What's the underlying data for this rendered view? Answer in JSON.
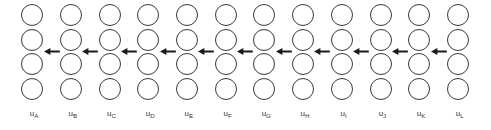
{
  "diagram": {
    "type": "node-chain-diagram",
    "background_color": "#ffffff",
    "stroke_color": "#3a3a3a",
    "arrow_color": "#1a1a1a",
    "label_color": "#333333",
    "rows_per_column": 4,
    "arrow_direction": "left",
    "arrow_count": 11,
    "columns": [
      {
        "label_base": "u",
        "label_sub": "A"
      },
      {
        "label_base": "u",
        "label_sub": "B"
      },
      {
        "label_base": "u",
        "label_sub": "C"
      },
      {
        "label_base": "u",
        "label_sub": "D"
      },
      {
        "label_base": "u",
        "label_sub": "E"
      },
      {
        "label_base": "u",
        "label_sub": "F"
      },
      {
        "label_base": "u",
        "label_sub": "G"
      },
      {
        "label_base": "u",
        "label_sub": "H"
      },
      {
        "label_base": "u",
        "label_sub": "I"
      },
      {
        "label_base": "u",
        "label_sub": "J"
      },
      {
        "label_base": "u",
        "label_sub": "K"
      },
      {
        "label_base": "u",
        "label_sub": "L"
      }
    ]
  }
}
